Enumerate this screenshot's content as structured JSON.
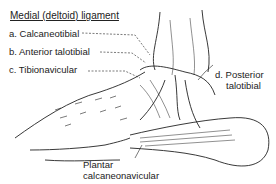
{
  "diagram": {
    "title": "Medial (deltoid) ligament",
    "labels": {
      "a": "a. Calcaneotibial",
      "b": "b. Anterior talotibial",
      "c": "c. Tibionavicular",
      "d_line1": "d. Posterior",
      "d_line2": "talotibial",
      "plantar_line1": "Plantar",
      "plantar_line2": "calcaneonavicular"
    },
    "colors": {
      "ink": "#222222",
      "background": "#ffffff"
    }
  }
}
